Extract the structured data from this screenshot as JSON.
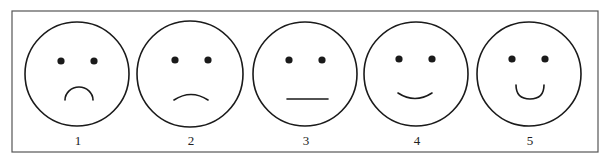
{
  "scale": {
    "title": "",
    "faces": [
      {
        "label": "1",
        "expression": "very-sad",
        "cx": 77,
        "cy": 74,
        "r": 52,
        "eyes": [
          [
            61,
            61
          ],
          [
            94,
            61
          ]
        ],
        "mouth": "M65 100 A14 13 0 0 1 93 100"
      },
      {
        "label": "2",
        "expression": "sad",
        "cx": 190,
        "cy": 74,
        "r": 53,
        "eyes": [
          [
            175,
            60
          ],
          [
            208,
            60
          ]
        ],
        "mouth": "M174 100 Q191 89 208 100"
      },
      {
        "label": "3",
        "expression": "neutral",
        "cx": 305,
        "cy": 74,
        "r": 52,
        "eyes": [
          [
            289,
            60
          ],
          [
            322,
            60
          ]
        ],
        "mouth": "M287 99 L328 99"
      },
      {
        "label": "4",
        "expression": "happy",
        "cx": 416,
        "cy": 74,
        "r": 52,
        "eyes": [
          [
            399,
            59
          ],
          [
            432,
            59
          ]
        ],
        "mouth": "M398 93 Q415 104 432 93"
      },
      {
        "label": "5",
        "expression": "very-happy",
        "cx": 529,
        "cy": 74,
        "r": 52,
        "eyes": [
          [
            512,
            59
          ],
          [
            545,
            59
          ]
        ],
        "mouth": "M516 85 Q516 99 530 99 Q544 99 544 85"
      }
    ],
    "label_y": 145
  },
  "colors": {
    "stroke": "#1a1a1a",
    "frame": "#555555",
    "background": "#ffffff"
  }
}
